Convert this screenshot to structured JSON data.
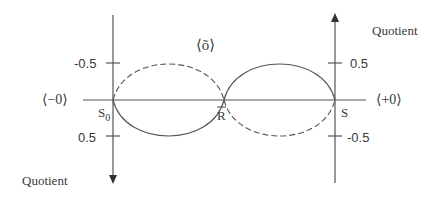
{
  "diagram": {
    "axes": {
      "left": {
        "title": "Quotient",
        "ticks": [
          {
            "label": "-0.5"
          },
          {
            "label": "0.5"
          }
        ],
        "direction": "down"
      },
      "right": {
        "title": "Quotient",
        "ticks": [
          {
            "label": "0.5"
          },
          {
            "label": "-0.5"
          }
        ],
        "direction": "up"
      }
    },
    "horizontal": {
      "left_end_label": "⟨−0⟩",
      "right_end_label": "⟨+0⟩"
    },
    "points": {
      "left": "S",
      "left_subscript": "0",
      "middle": "R",
      "right": "S"
    },
    "center_label": "⟨õ⟩",
    "colors": {
      "line": "#555555",
      "text": "#3a3a3a"
    }
  }
}
